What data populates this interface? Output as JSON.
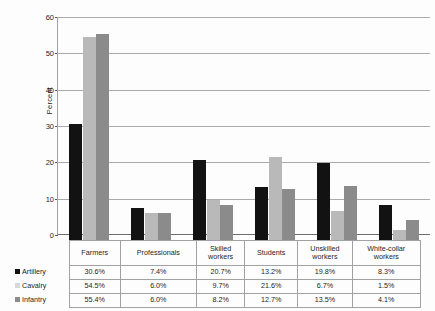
{
  "chart_data": {
    "type": "bar",
    "title": "",
    "subtitle": "",
    "xlabel": "",
    "ylabel": "Percent",
    "ylim": [
      0,
      60
    ],
    "yticks": [
      0,
      10,
      20,
      30,
      40,
      50,
      60
    ],
    "ytick_labels": [
      "0",
      "10",
      "20",
      "30",
      "40",
      "50",
      "60"
    ],
    "grid": true,
    "legend_position": "table-row-labels",
    "categories": [
      "Farmers",
      "Professionals",
      "Skilled workers",
      "Students",
      "Unskilled workers",
      "White-collar workers"
    ],
    "category_lines": [
      [
        "Farmers"
      ],
      [
        "Professionals"
      ],
      [
        "Skilled",
        "workers"
      ],
      [
        "Students"
      ],
      [
        "Unskilled",
        "workers"
      ],
      [
        "White-collar",
        "workers"
      ]
    ],
    "series": [
      {
        "name": "Artillery",
        "color": "#121212",
        "swatch": "#121212",
        "values": [
          30.6,
          7.4,
          20.7,
          13.2,
          19.8,
          8.3
        ],
        "labels": [
          "30.6%",
          "7.4%",
          "20.7%",
          "13.2%",
          "19.8%",
          "8.3%"
        ]
      },
      {
        "name": "Cavalry",
        "color": "#b9b9b9",
        "swatch": "#d8d8d8",
        "values": [
          54.5,
          6.0,
          9.7,
          21.6,
          6.7,
          1.5
        ],
        "labels": [
          "54.5%",
          "6.0%",
          "9.7%",
          "21.6%",
          "6.7%",
          "1.5%"
        ]
      },
      {
        "name": "Infantry",
        "color": "#8b8b8b",
        "swatch": "#8b8b8b",
        "values": [
          55.4,
          6.0,
          8.2,
          12.7,
          13.5,
          4.1
        ],
        "labels": [
          "55.4%",
          "6.0%",
          "8.2%",
          "12.7%",
          "13.5%",
          "4.1%"
        ]
      }
    ]
  },
  "table": {
    "corner_label": "",
    "column_headers": [
      "Farmers",
      "Professionals",
      "Skilled workers",
      "Students",
      "Unskilled workers",
      "White-collar workers"
    ],
    "rows": [
      {
        "label": "Artillery",
        "values": [
          "30.6%",
          "7.4%",
          "20.7%",
          "13.2%",
          "19.8%",
          "8.3%"
        ]
      },
      {
        "label": "Cavalry",
        "values": [
          "54.5%",
          "6.0%",
          "9.7%",
          "21.6%",
          "6.7%",
          "1.5%"
        ]
      },
      {
        "label": "Infantry",
        "values": [
          "55.4%",
          "6.0%",
          "8.2%",
          "12.7%",
          "13.5%",
          "4.1%"
        ]
      }
    ]
  }
}
